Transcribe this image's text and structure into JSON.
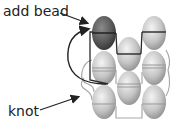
{
  "labels": {
    "add_bead": "add bead",
    "knot": "knot"
  },
  "colors": {
    "dark_bead": "#5e5e5e",
    "light_bead": "#c8c8c8",
    "thread_dark": "#2b2b2b",
    "thread_light": "#a0a0a0",
    "text": "#222222"
  },
  "beads": [
    {
      "col": 1,
      "row": 1,
      "cx": 104,
      "cy": 33,
      "shade": "dark"
    },
    {
      "col": 1,
      "row": 2,
      "cx": 104,
      "cy": 68,
      "shade": "light"
    },
    {
      "col": 1,
      "row": 3,
      "cx": 104,
      "cy": 102,
      "shade": "light"
    },
    {
      "col": 2,
      "row": 1,
      "cx": 129,
      "cy": 54,
      "shade": "light"
    },
    {
      "col": 2,
      "row": 2,
      "cx": 129,
      "cy": 88,
      "shade": "light"
    },
    {
      "col": 3,
      "row": 1,
      "cx": 154,
      "cy": 33,
      "shade": "light"
    },
    {
      "col": 3,
      "row": 2,
      "cx": 154,
      "cy": 68,
      "shade": "light"
    },
    {
      "col": 3,
      "row": 3,
      "cx": 154,
      "cy": 102,
      "shade": "light"
    }
  ]
}
